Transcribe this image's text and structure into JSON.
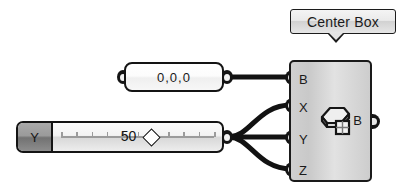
{
  "canvas": {
    "background": "#ffffff",
    "wire_color": "#121212"
  },
  "tooltip": {
    "label": "Center Box",
    "pointer": "down"
  },
  "panel": {
    "name": "panel",
    "value": "0,0,0",
    "input_port": "input-port",
    "output_port": "output-port"
  },
  "slider": {
    "name_label": "Y",
    "value": "50",
    "handle": "diamond-handle",
    "output_port": "output-port",
    "tick_count": 11
  },
  "node": {
    "title": "Center Box",
    "icon_name": "center-box-icon",
    "inputs": [
      {
        "label": "B"
      },
      {
        "label": "X"
      },
      {
        "label": "Y"
      },
      {
        "label": "Z"
      }
    ],
    "outputs": [
      {
        "label": "B"
      }
    ]
  },
  "connections": [
    {
      "from": "panel.output",
      "to": "node.input.B"
    },
    {
      "from": "slider.output",
      "to": "node.input.X"
    },
    {
      "from": "slider.output",
      "to": "node.input.Y"
    },
    {
      "from": "slider.output",
      "to": "node.input.Z"
    }
  ]
}
